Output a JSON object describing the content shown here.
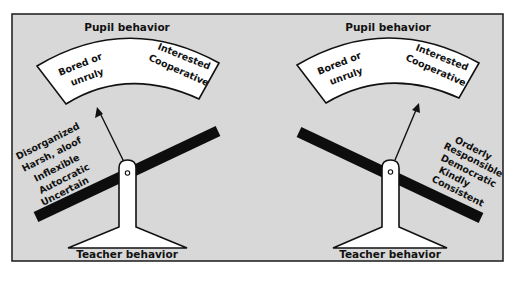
{
  "diagram": {
    "left_panel": {
      "top_label": "Pupil behavior",
      "gauge": {
        "left_label_lines": [
          "Bored or",
          "unruly"
        ],
        "right_label_lines": [
          "Interested",
          "Cooperative"
        ]
      },
      "needle_points_to": "Bored or unruly",
      "lever_tilt": "raised right, lowered left",
      "side_labels": [
        "Disorganized",
        "Harsh, aloof",
        "Inflexible",
        "Autocratic",
        "Uncertain"
      ],
      "bottom_label": "Teacher behavior"
    },
    "right_panel": {
      "top_label": "Pupil behavior",
      "gauge": {
        "left_label_lines": [
          "Bored or",
          "unruly"
        ],
        "right_label_lines": [
          "Interested",
          "Cooperative"
        ]
      },
      "needle_points_to": "Interested Cooperative",
      "lever_tilt": "raised left, lowered right",
      "side_labels": [
        "Orderly",
        "Responsible",
        "Democratic",
        "Kindly",
        "Consistent"
      ],
      "bottom_label": "Teacher behavior"
    },
    "colors": {
      "background": "#d8d8d8",
      "ink": "#111111",
      "fill": "#ffffff"
    }
  }
}
